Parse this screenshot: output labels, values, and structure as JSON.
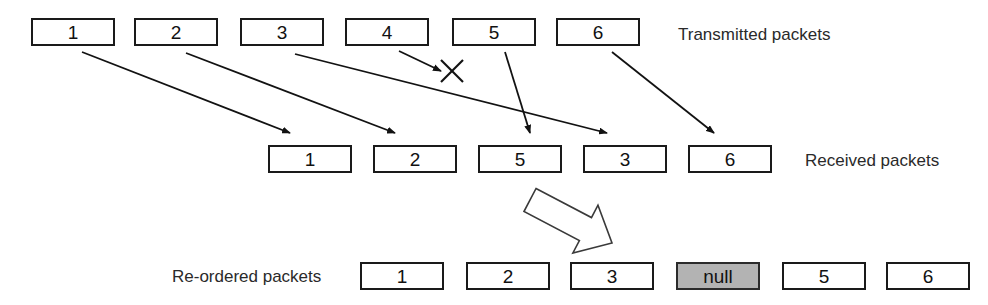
{
  "diagram": {
    "box_width": 84,
    "box_height": 28,
    "colors": {
      "stroke": "#1a1a1a",
      "box_fill": "#ffffff",
      "null_fill": "#b3b3b3",
      "text": "#111111",
      "label_text": "#2a2a2a"
    }
  },
  "rows": {
    "transmitted": {
      "label": "Transmitted packets",
      "label_x": 678,
      "label_y": 26,
      "y": 18,
      "packets": [
        {
          "text": "1",
          "x": 31
        },
        {
          "text": "2",
          "x": 134
        },
        {
          "text": "3",
          "x": 240
        },
        {
          "text": "4",
          "x": 345
        },
        {
          "text": "5",
          "x": 452
        },
        {
          "text": "6",
          "x": 556
        }
      ]
    },
    "received": {
      "label": "Received packets",
      "label_x": 805,
      "label_y": 152,
      "y": 145,
      "packets": [
        {
          "text": "1",
          "x": 268
        },
        {
          "text": "2",
          "x": 373
        },
        {
          "text": "5",
          "x": 478
        },
        {
          "text": "3",
          "x": 583
        },
        {
          "text": "6",
          "x": 688
        }
      ]
    },
    "reordered": {
      "label": "Re-ordered packets",
      "label_x": 172,
      "label_y": 268,
      "y": 262,
      "packets": [
        {
          "text": "1",
          "x": 360,
          "null": false
        },
        {
          "text": "2",
          "x": 466,
          "null": false
        },
        {
          "text": "3",
          "x": 570,
          "null": false
        },
        {
          "text": "null",
          "x": 676,
          "null": true
        },
        {
          "text": "5",
          "x": 782,
          "null": false
        },
        {
          "text": "6",
          "x": 886,
          "null": false
        }
      ]
    }
  },
  "connectors": [
    {
      "name": "arrow-pkt-1",
      "x1": 82,
      "y1": 52,
      "x2": 290,
      "y2": 133
    },
    {
      "name": "arrow-pkt-2",
      "x1": 186,
      "y1": 53,
      "x2": 395,
      "y2": 133
    },
    {
      "name": "arrow-pkt-3",
      "x1": 295,
      "y1": 54,
      "x2": 607,
      "y2": 133
    },
    {
      "name": "arrow-pkt-4-lost",
      "x1": 399,
      "y1": 51,
      "x2": 441,
      "y2": 71
    },
    {
      "name": "arrow-pkt-5",
      "x1": 505,
      "y1": 52,
      "x2": 530,
      "y2": 133
    },
    {
      "name": "arrow-pkt-6",
      "x1": 612,
      "y1": 52,
      "x2": 714,
      "y2": 133
    }
  ],
  "drop_marker": {
    "name": "packet-loss-x",
    "cx": 452,
    "cy": 71,
    "size": 11
  },
  "block_arrow": {
    "name": "reorder-block-arrow",
    "tail_x": 530,
    "tail_y": 200,
    "head_x": 612,
    "head_y": 243
  }
}
